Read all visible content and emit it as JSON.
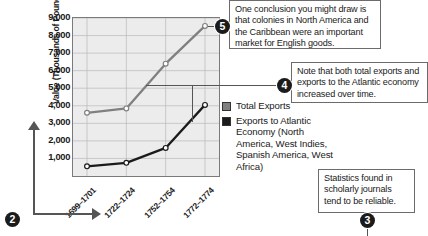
{
  "chart_data": {
    "type": "line",
    "title": "",
    "xlabel": "",
    "ylabel": "Value (Thousands of Pounds Sterling)",
    "categories": [
      "1699–1701",
      "1722–1724",
      "1752–1754",
      "1772–1774"
    ],
    "ylim": [
      0,
      9000
    ],
    "yticks": [
      1000,
      2000,
      3000,
      4000,
      5000,
      6000,
      7000,
      8000,
      9000
    ],
    "ytick_labels": [
      "1,000",
      "2,000",
      "3,000",
      "4,000",
      "5,000",
      "6,000",
      "7,000",
      "8,000",
      "9,000"
    ],
    "grid": true,
    "legend_position": "right",
    "series": [
      {
        "name": "Total Exports",
        "color": "#808080",
        "values": [
          3600,
          3850,
          6400,
          8550
        ]
      },
      {
        "name": "Exports to Atlantic Economy (North America, West Indies, Spanish America, West Africa)",
        "color": "#1b1b1b",
        "values": [
          550,
          750,
          1600,
          4050
        ]
      }
    ]
  },
  "legend": {
    "items": [
      {
        "label": "Total Exports",
        "color": "#808080"
      },
      {
        "label": "Exports to Atlantic Economy (North America, West Indies, Spanish America, West Africa)",
        "color": "#1b1b1b"
      }
    ]
  },
  "callouts": [
    {
      "number": "5",
      "text": "One conclusion you might draw is that colonies in North America and the Caribbean were an important market for English goods."
    },
    {
      "number": "4",
      "text": "Note that both total exports and exports to the Atlantic economy increased over time."
    },
    {
      "number": "3",
      "text": "Statistics found in scholarly journals tend to be reliable."
    }
  ],
  "markers": {
    "axes_marker": "2"
  }
}
